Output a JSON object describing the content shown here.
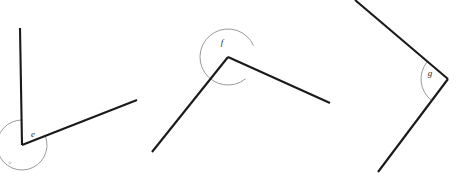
{
  "page": {
    "background_color": "#ffffff",
    "width": 459,
    "height": 176
  },
  "style": {
    "ray_color": "#1a1a1a",
    "arc_color": "#8e8e8e",
    "label_color": "#2b2b2b",
    "ray_width": 2.1,
    "arc_width": 0.9
  },
  "figures": [
    {
      "id": "angle-e",
      "label": "e",
      "type": "acute",
      "vertex": {
        "x": 22,
        "y": 145
      },
      "rays": [
        {
          "name": "upper-ray",
          "x1": 22,
          "y1": 145,
          "x2": 20,
          "y2": 28
        },
        {
          "name": "right-ray",
          "x1": 22,
          "y1": 145,
          "x2": 137,
          "y2": 100
        }
      ],
      "arc": {
        "radius": 25,
        "start_deg": 89,
        "end_deg": 21,
        "reflex": false
      },
      "label_pos": {
        "x": 33,
        "y": 135
      }
    },
    {
      "id": "angle-f",
      "label": "f",
      "type": "reflex",
      "vertex": {
        "x": 228,
        "y": 57
      },
      "rays": [
        {
          "name": "left-ray",
          "x1": 228,
          "y1": 57,
          "x2": 152,
          "y2": 152
        },
        {
          "name": "right-ray",
          "x1": 228,
          "y1": 57,
          "x2": 330,
          "y2": 103
        }
      ],
      "arc": {
        "radius": 28,
        "start_deg": 24,
        "end_deg": 309,
        "reflex": true
      },
      "label_pos": {
        "x": 222,
        "y": 43
      }
    },
    {
      "id": "angle-g",
      "label": "g",
      "type": "obtuse",
      "vertex": {
        "x": 448,
        "y": 79
      },
      "rays": [
        {
          "name": "upper-ray",
          "x1": 448,
          "y1": 79,
          "x2": 355,
          "y2": 0
        },
        {
          "name": "lower-ray",
          "x1": 448,
          "y1": 79,
          "x2": 378,
          "y2": 172
        }
      ],
      "arc": {
        "radius": 27,
        "start_deg": 140,
        "end_deg": 233,
        "reflex": false
      },
      "label_pos": {
        "x": 430,
        "y": 74
      }
    }
  ],
  "specks": [
    {
      "name": "speck-bottom-left",
      "x": 10,
      "y": 163,
      "r": 1.6
    }
  ]
}
